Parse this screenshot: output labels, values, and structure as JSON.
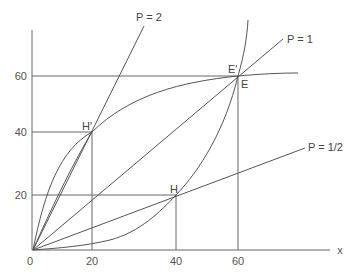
{
  "diagram": {
    "type": "economics-offer-curve-diagram",
    "axes": {
      "x_label": "x",
      "x_ticks": [
        "0",
        "20",
        "40",
        "60"
      ],
      "y_ticks": [
        "20",
        "40",
        "60"
      ]
    },
    "price_lines": [
      {
        "label": "P = 2",
        "slope": 2
      },
      {
        "label": "P = 1",
        "slope": 1
      },
      {
        "label": "P = 1/2",
        "slope": 0.5
      }
    ],
    "points": [
      {
        "label": "H'",
        "x": 20,
        "y": 40
      },
      {
        "label": "H",
        "x": 40,
        "y": 20
      },
      {
        "label": "E'",
        "x": 60,
        "y": 60
      },
      {
        "label": "E",
        "x": 60,
        "y": 60
      }
    ],
    "curves": [
      {
        "name": "offer-curve-concave",
        "passes_through": [
          "0,0",
          "H'",
          "E'"
        ]
      },
      {
        "name": "offer-curve-convex",
        "passes_through": [
          "0,0",
          "H",
          "E"
        ]
      }
    ],
    "guide_lines": [
      {
        "name": "y=60 horizontal"
      },
      {
        "name": "y=40 horizontal to H'"
      },
      {
        "name": "y=20 horizontal to H"
      },
      {
        "name": "x=20 vertical from H'"
      },
      {
        "name": "x=40 vertical from H"
      },
      {
        "name": "x=60 vertical from E"
      }
    ]
  }
}
